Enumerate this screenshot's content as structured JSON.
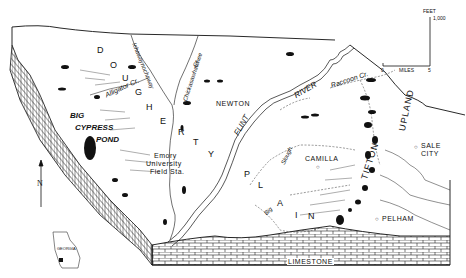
{
  "diagram": {
    "type": "physiographic-block-diagram",
    "regions": [
      {
        "id": "dougherty",
        "letters": [
          "D",
          "O",
          "U",
          "G",
          "H",
          "E",
          "R",
          "T",
          "Y"
        ]
      },
      {
        "id": "plain",
        "letters": [
          "P",
          "L",
          "A",
          "I",
          "N"
        ]
      },
      {
        "id": "tifton",
        "label": "TIFTON"
      },
      {
        "id": "upland",
        "label": "UPLAND"
      }
    ],
    "features": {
      "big_cypress_pond": [
        "BIG",
        "CYPRESS",
        "POND"
      ],
      "flint_river": [
        "FLINT",
        "RIVER"
      ],
      "ichawaynochaway": "Ichawaynochaway",
      "chickasawhatchee": [
        "Chickasawhatchee",
        "Cr."
      ],
      "alligator_cr": "Alligator Cr.",
      "raccoon_cr": "Raccoon Cr.",
      "big_slough": [
        "Big",
        "Slough"
      ]
    },
    "places": {
      "newton": "NEWTON",
      "camilla": "CAMILLA",
      "sale_city": [
        "SALE",
        "CITY"
      ],
      "pelham": "PELHAM",
      "emory": [
        "Emory",
        "University",
        "Field Sta."
      ]
    },
    "subsurface": "LIMESTONE",
    "scale": {
      "vertical_unit": "FEET",
      "vertical_value": "1,000",
      "horizontal_unit": "MILES",
      "horizontal_start": "0",
      "horizontal_end": "5"
    },
    "north_arrow": "N",
    "inset": "GEORGIA"
  }
}
